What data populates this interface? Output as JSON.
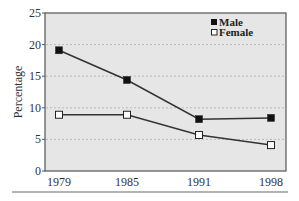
{
  "chart_data": {
    "type": "line",
    "title": "",
    "xlabel": "",
    "ylabel": "Percentage",
    "categories": [
      "1979",
      "1985",
      "1991",
      "1998"
    ],
    "series": [
      {
        "name": "Male",
        "marker": "filled-square",
        "values": [
          19.1,
          14.4,
          8.2,
          8.4
        ]
      },
      {
        "name": "Female",
        "marker": "open-square",
        "values": [
          8.9,
          8.9,
          5.7,
          4.1
        ]
      }
    ],
    "ylim": [
      0,
      25
    ],
    "yticks": [
      0,
      5,
      10,
      15,
      20,
      25
    ],
    "grid": "horizontal-dotted",
    "legend_position": "top-right-inside",
    "colors": {
      "plot_background": "#e6e6e6",
      "frame": "#555555",
      "gridline": "#bbbbbb",
      "line": "#333333",
      "male_marker": "#111111",
      "female_marker": "#ffffff"
    }
  },
  "legend": {
    "male_label": "Male",
    "female_label": "Female"
  },
  "axes": {
    "ylabel": "Percentage",
    "yticks": [
      "0",
      "5",
      "10",
      "15",
      "20",
      "25"
    ],
    "xticks": [
      "1979",
      "1985",
      "1991",
      "1998"
    ]
  }
}
